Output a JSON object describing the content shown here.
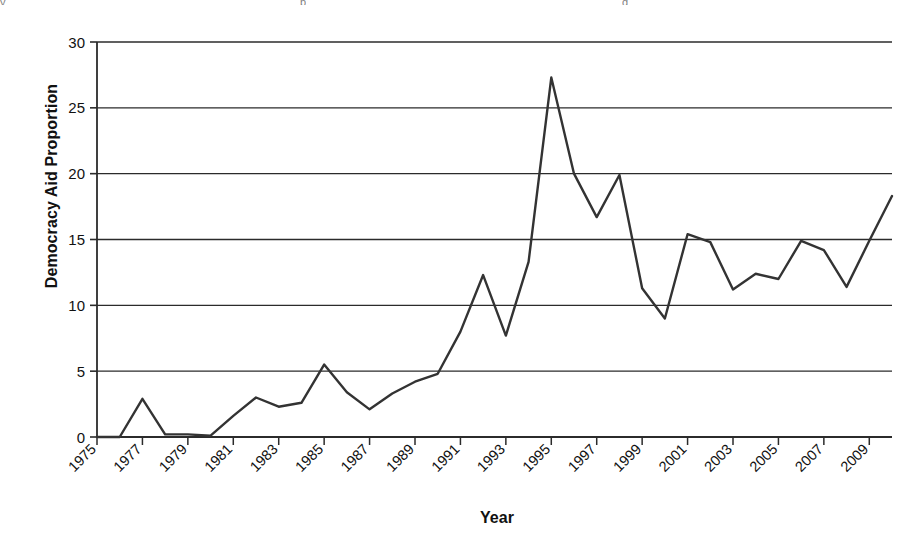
{
  "figure": {
    "top_artifacts": [
      {
        "text": "y",
        "left": 8
      },
      {
        "text": "p",
        "left": 300
      },
      {
        "text": "g",
        "left": 622
      }
    ]
  },
  "chart_data": {
    "type": "line",
    "title": "",
    "subtitle": "",
    "xlabel": "Year",
    "ylabel": "Democracy Aid Proportion",
    "xlim": [
      1975,
      2010
    ],
    "ylim": [
      0,
      30
    ],
    "ytick_values": [
      0,
      5,
      10,
      15,
      20,
      25,
      30
    ],
    "ytick_labels": [
      "0",
      "5",
      "10",
      "15",
      "20",
      "25",
      "30"
    ],
    "xtick_values": [
      1975,
      1977,
      1979,
      1981,
      1983,
      1985,
      1987,
      1989,
      1991,
      1993,
      1995,
      1997,
      1999,
      2001,
      2003,
      2005,
      2007,
      2009
    ],
    "xtick_labels": [
      "1975",
      "1977",
      "1979",
      "1981",
      "1983",
      "1985",
      "1987",
      "1989",
      "1991",
      "1993",
      "1995",
      "1997",
      "1999",
      "2001",
      "2003",
      "2005",
      "2007",
      "2009"
    ],
    "xtick_rotation": -45,
    "grid": {
      "horizontal": true,
      "vertical": false
    },
    "legend": {
      "visible": false,
      "position": "none"
    },
    "line_color": "#333333",
    "line_width": 2.4,
    "markers": "none",
    "x": [
      1975,
      1976,
      1977,
      1978,
      1979,
      1980,
      1981,
      1982,
      1983,
      1984,
      1985,
      1986,
      1987,
      1988,
      1989,
      1990,
      1991,
      1992,
      1993,
      1994,
      1995,
      1996,
      1997,
      1998,
      1999,
      2000,
      2001,
      2002,
      2003,
      2004,
      2005,
      2006,
      2007,
      2008,
      2009,
      2010
    ],
    "values": [
      0.0,
      0.0,
      2.9,
      0.2,
      0.2,
      0.1,
      1.6,
      3.0,
      2.3,
      2.6,
      5.5,
      3.4,
      2.1,
      3.3,
      4.2,
      4.8,
      8.0,
      12.3,
      7.7,
      13.3,
      27.3,
      20.0,
      16.7,
      19.9,
      11.3,
      9.0,
      15.4,
      14.8,
      11.2,
      12.4,
      12.0,
      14.9,
      14.2,
      11.4,
      14.9,
      18.3
    ],
    "series": [
      {
        "name": "Democracy Aid Proportion",
        "values": [
          0.0,
          0.0,
          2.9,
          0.2,
          0.2,
          0.1,
          1.6,
          3.0,
          2.3,
          2.6,
          5.5,
          3.4,
          2.1,
          3.3,
          4.2,
          4.8,
          8.0,
          12.3,
          7.7,
          13.3,
          27.3,
          20.0,
          16.7,
          19.9,
          11.3,
          9.0,
          15.4,
          14.8,
          11.2,
          12.4,
          12.0,
          14.9,
          14.2,
          11.4,
          14.9,
          18.3
        ]
      }
    ]
  }
}
